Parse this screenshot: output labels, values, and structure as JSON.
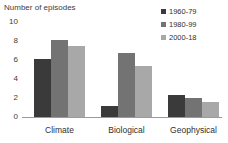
{
  "chart_data": {
    "type": "bar",
    "title": "",
    "ylabel": "Number of episodes",
    "xlabel": "",
    "ylim": [
      0,
      10
    ],
    "yticks": [
      0,
      2,
      4,
      6,
      8,
      10
    ],
    "grid": false,
    "legend_position": "top-right",
    "categories": [
      "Climate",
      "Biological",
      "Geophysical"
    ],
    "series": [
      {
        "name": "1960-79",
        "color": "#3a3a3a",
        "values": [
          6.1,
          1.2,
          2.3
        ]
      },
      {
        "name": "1980-99",
        "color": "#737373",
        "values": [
          8.1,
          6.7,
          2.0
        ]
      },
      {
        "name": "2000-18",
        "color": "#a8a8a8",
        "values": [
          7.5,
          5.4,
          1.6
        ]
      }
    ]
  },
  "axis_title": "Number of episodes",
  "yticks": {
    "t0": "0",
    "t1": "2",
    "t2": "4",
    "t3": "6",
    "t4": "8",
    "t5": "10"
  },
  "legend": [
    {
      "label": "1960-79"
    },
    {
      "label": "1980-99"
    },
    {
      "label": "2000-18"
    }
  ],
  "categories": [
    {
      "label": "Climate"
    },
    {
      "label": "Biological"
    },
    {
      "label": "Geophysical"
    }
  ]
}
